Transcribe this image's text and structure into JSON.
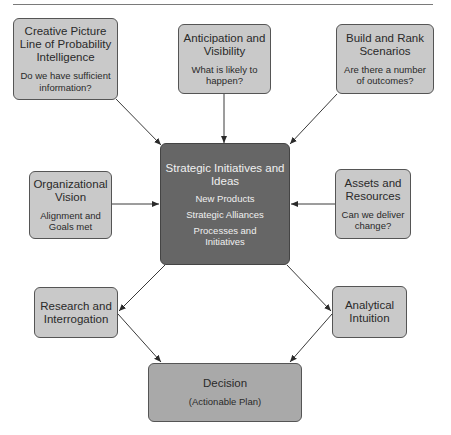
{
  "diagram": {
    "nodes": {
      "creative_picture": {
        "title": "Creative Picture Line of Probability Intelligence",
        "question": "Do we have sufficient information?"
      },
      "anticipation": {
        "title": "Anticipation and Visibility",
        "question": "What is likely to happen?"
      },
      "build_rank": {
        "title": "Build and Rank Scenarios",
        "question": "Are there a number of outcomes?"
      },
      "organizational_vision": {
        "title": "Organizational Vision",
        "question": "Alignment and Goals met"
      },
      "assets_resources": {
        "title": "Assets and Resources",
        "question": "Can we deliver change?"
      },
      "strategic": {
        "title": "Strategic Initiatives and Ideas",
        "items": [
          "New Products",
          "Strategic Alliances",
          "Processes and Initiatives"
        ]
      },
      "research": {
        "title": "Research and Interrogation"
      },
      "analytical": {
        "title": "Analytical Intuition"
      },
      "decision": {
        "title": "Decision",
        "subtitle": "(Actionable Plan)"
      }
    },
    "edges": [
      {
        "from": "creative_picture",
        "to": "strategic"
      },
      {
        "from": "anticipation",
        "to": "strategic"
      },
      {
        "from": "build_rank",
        "to": "strategic"
      },
      {
        "from": "organizational_vision",
        "to": "strategic"
      },
      {
        "from": "assets_resources",
        "to": "strategic"
      },
      {
        "from": "strategic",
        "to": "research"
      },
      {
        "from": "strategic",
        "to": "analytical"
      },
      {
        "from": "research",
        "to": "decision"
      },
      {
        "from": "analytical",
        "to": "decision"
      }
    ],
    "colors": {
      "box_fill": "#c9c9c9",
      "center_fill": "#666666",
      "decision_fill": "#a9a9a9",
      "line": "#3a3a3a"
    }
  }
}
